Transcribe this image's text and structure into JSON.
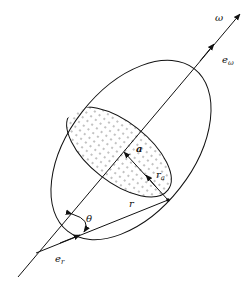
{
  "diagram": {
    "labels": {
      "omega": "ω",
      "e_omega": "e",
      "e_omega_sub": "ω",
      "a": "a",
      "r_a": "r",
      "r_a_sub": "a",
      "r": "r",
      "theta": "θ",
      "e_r": "e",
      "e_r_sub": "r"
    },
    "colors": {
      "stroke": "#111111",
      "dots": "#555555",
      "background": "#ffffff"
    }
  }
}
